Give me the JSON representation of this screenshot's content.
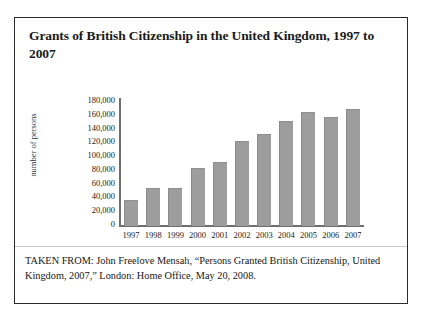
{
  "figure": {
    "title": "Grants of British Citizenship in the United Kingdom, 1997 to 2007",
    "caption": "TAKEN FROM: John Freelove Mensah, “Persons Granted British Citizenship, United Kingdom, 2007,” London: Home Office, May 20, 2008."
  },
  "colors": {
    "bar_fill": "#9d9d9d",
    "axis": "#6f6f6f",
    "frame_border": "#2b2b2b",
    "text": "#1a1a1a"
  },
  "chart_data": {
    "type": "bar",
    "title": "Grants of British Citizenship in the United Kingdom, 1997 to 2007",
    "xlabel": "",
    "ylabel": "number of persons",
    "categories": [
      "1997",
      "1998",
      "1999",
      "2000",
      "2001",
      "2002",
      "2003",
      "2004",
      "2005",
      "2006",
      "2007"
    ],
    "values": [
      37000,
      54000,
      54000,
      82000,
      90000,
      120000,
      130000,
      148000,
      161000,
      154000,
      164000
    ],
    "ylim": [
      0,
      180000
    ],
    "ytick_values": [
      0,
      20000,
      40000,
      60000,
      80000,
      100000,
      120000,
      140000,
      160000,
      180000
    ],
    "ytick_labels": [
      "0",
      "20,000",
      "40,000",
      "60,000",
      "80,000",
      "100,000",
      "120,000",
      "140,000",
      "160,000",
      "180,000"
    ],
    "grid": false,
    "legend": false
  }
}
